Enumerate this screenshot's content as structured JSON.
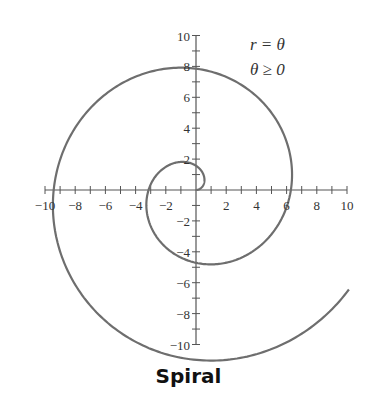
{
  "chart_data": {
    "type": "line",
    "title": "Spiral",
    "equation": {
      "line1": "r = θ",
      "line2": "θ ≥ 0"
    },
    "curve": {
      "kind": "polar",
      "r": "theta",
      "theta_range": [
        0,
        12.0
      ]
    },
    "xlabel": "",
    "ylabel": "",
    "xlim": [
      -10,
      10
    ],
    "ylim": [
      -10,
      10
    ],
    "x_ticks": [
      -10,
      -8,
      -6,
      -4,
      -2,
      2,
      4,
      6,
      8,
      10
    ],
    "y_ticks": [
      -10,
      -8,
      -6,
      -4,
      -2,
      2,
      4,
      6,
      8,
      10
    ],
    "minor_tick_step": 1,
    "grid": false,
    "legend": "none",
    "line_color": "#6e6e6e"
  },
  "caption": "Spiral"
}
